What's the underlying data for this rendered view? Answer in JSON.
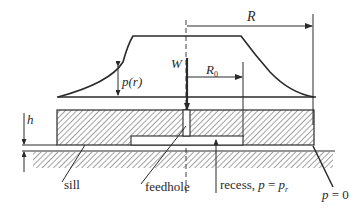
{
  "diagram": {
    "colors": {
      "line": "#2a2a2a",
      "hatch": "#555555",
      "background": "#ffffff"
    },
    "labels": {
      "outer_radius": "R",
      "recess_radius": "R",
      "recess_radius_sub": "0",
      "load": "W",
      "pressure": "p(r)",
      "film_thickness": "h",
      "sill": "sill",
      "feedhole": "feedhole",
      "recess_text": "recess, ",
      "recess_eq_p": "p",
      "recess_eq_sign": " = ",
      "recess_eq_pr": "p",
      "recess_eq_sub": "r",
      "edge_p": "p",
      "edge_eq": " = 0"
    }
  }
}
